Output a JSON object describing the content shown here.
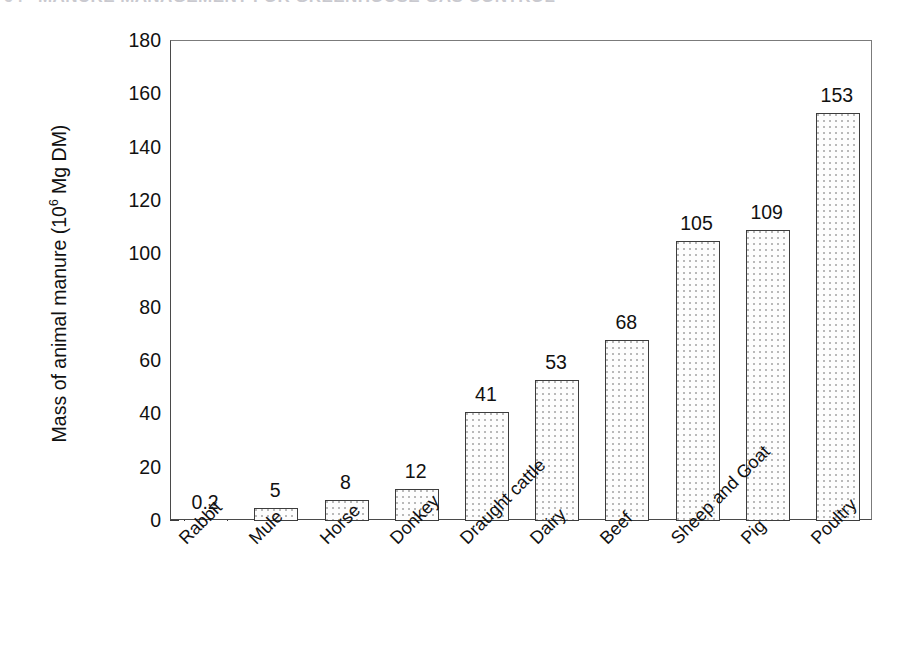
{
  "page_header": {
    "folio": "94",
    "running_title": "MANURE MANAGEMENT FOR GREENHOUSE GAS CONTROL"
  },
  "chart_data": {
    "type": "bar",
    "title": "",
    "subtitle": "",
    "xlabel": "",
    "ylabel": "Mass of animal manure (10⁶ Mg DM)",
    "ylabel_parts": {
      "prefix": "Mass of animal manure (10",
      "exponent": "6",
      "suffix": " Mg DM)"
    },
    "categories": [
      "Rabbit",
      "Mule",
      "Horse",
      "Donkey",
      "Draught cattle",
      "Dairy",
      "Beef",
      "Sheep and Goat",
      "Pig",
      "Poultry"
    ],
    "values": [
      0.2,
      5,
      8,
      12,
      41,
      53,
      68,
      105,
      109,
      153
    ],
    "value_labels": [
      "0.2",
      "5",
      "8",
      "12",
      "41",
      "53",
      "68",
      "105",
      "109",
      "153"
    ],
    "ylim": [
      0,
      180
    ],
    "y_ticks": [
      0,
      20,
      40,
      60,
      80,
      100,
      120,
      140,
      160,
      180
    ],
    "y_tick_labels": [
      "0",
      "20",
      "40",
      "60",
      "80",
      "100",
      "120",
      "140",
      "160",
      "180"
    ],
    "y_minor_tick_step": 5,
    "grid": false,
    "legend": null,
    "legend_position": "none",
    "bar_fill": "#fdfdfd",
    "bar_fill_pattern": "fine-stipple-dots",
    "bar_edge_color": "#3d3d3d",
    "axis_color": "#4a4a4a",
    "text_color": "#111111",
    "x_tick_label_rotation": -45
  }
}
